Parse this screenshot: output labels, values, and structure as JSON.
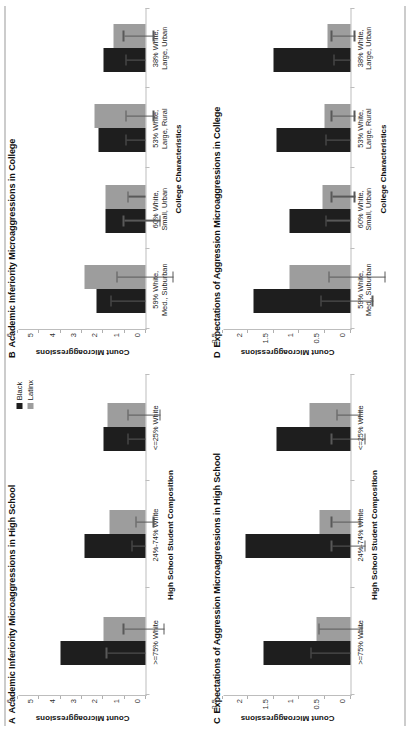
{
  "figure": {
    "legend": [
      {
        "label": "Black",
        "color": "#1e1e1e"
      },
      {
        "label": "Latinx",
        "color": "#9d9d9d"
      }
    ]
  },
  "chart_data": [
    {
      "type": "bar",
      "panel": "A",
      "title": "Academic Inferiority Microaggressions in High School",
      "xlabel": "High School Student Composition",
      "ylabel": "Count Microaggressions",
      "ylim": [
        0,
        6
      ],
      "yticks": [
        0,
        1,
        2,
        3,
        4,
        5,
        6
      ],
      "ytick_labels": [
        "0",
        "1",
        "2",
        "3",
        "4",
        "5",
        "6"
      ],
      "grid": false,
      "legend_position": "top-right",
      "categories": [
        ">=75% White",
        "24%-74% White",
        "<=25% White"
      ],
      "series": [
        {
          "name": "Black",
          "values": [
            4.0,
            2.9,
            2.0
          ],
          "err_high": [
            5.8,
            3.5,
            2.8
          ],
          "err_low": [
            4.0,
            2.9,
            2.0
          ]
        },
        {
          "name": "Latinx",
          "values": [
            2.0,
            1.7,
            1.8
          ],
          "err_high": [
            3.0,
            2.1,
            2.6
          ],
          "err_low": [
            1.1,
            1.3,
            1.1
          ]
        }
      ]
    },
    {
      "type": "bar",
      "panel": "B",
      "title": "Academic Inferiority Microaggressions in College",
      "xlabel": "College Characteristics",
      "ylabel": "Count Microaggressions",
      "ylim": [
        0,
        6
      ],
      "yticks": [
        0,
        1,
        2,
        3,
        4,
        5,
        6
      ],
      "ytick_labels": [
        "0",
        "1",
        "2",
        "3",
        "4",
        "5",
        "6"
      ],
      "grid": false,
      "legend_position": "none",
      "categories": [
        "59% White,\nMed., Suburban",
        "60% White,\nSmall, Urban",
        "53% White,\nLarge, Rural",
        "38% White,\nLarge, Urban"
      ],
      "series": [
        {
          "name": "Black",
          "values": [
            2.3,
            1.9,
            2.2,
            2.0
          ],
          "err_high": [
            3.9,
            2.9,
            3.1,
            2.9
          ],
          "err_low": [
            2.3,
            1.2,
            2.2,
            2.0
          ]
        },
        {
          "name": "Latinx",
          "values": [
            2.9,
            1.9,
            2.4,
            1.5
          ],
          "err_high": [
            4.2,
            2.7,
            3.3,
            2.5
          ],
          "err_low": [
            1.6,
            1.9,
            2.0,
            1.1
          ]
        }
      ]
    },
    {
      "type": "bar",
      "panel": "C",
      "title": "Expectations of Aggression Microaggressions in High School",
      "xlabel": "High School Student Composition",
      "ylabel": "Count Microaggressions",
      "ylim": [
        0,
        2.5
      ],
      "yticks": [
        0,
        0.5,
        1,
        1.5,
        2,
        2.5
      ],
      "ytick_labels": [
        "0",
        "0.5",
        "1",
        "1.5",
        "2",
        "2.5"
      ],
      "grid": false,
      "legend_position": "none",
      "categories": [
        ">=75% White",
        "24%-74% White",
        "<=25% White"
      ],
      "series": [
        {
          "name": "Black",
          "values": [
            1.7,
            2.05,
            1.45
          ],
          "err_high": [
            2.45,
            2.4,
            1.8
          ],
          "err_low": [
            1.7,
            1.75,
            1.15
          ]
        },
        {
          "name": "Latinx",
          "values": [
            0.65,
            0.6,
            0.8
          ],
          "err_high": [
            1.25,
            0.95,
            1.05
          ],
          "err_low": [
            0.4,
            0.4,
            0.6
          ]
        }
      ]
    },
    {
      "type": "bar",
      "panel": "D",
      "title": "Expectations of Aggression Microaggressions in College",
      "xlabel": "College Characteristics",
      "ylabel": "Count Microaggressions",
      "ylim": [
        0,
        2.5
      ],
      "yticks": [
        0,
        0.5,
        1,
        1.5,
        2,
        2.5
      ],
      "ytick_labels": [
        "0",
        "0.5",
        "1",
        "1.5",
        "2",
        "2.5"
      ],
      "grid": false,
      "legend_position": "none",
      "categories": [
        "59% White,\nMed., Suburban",
        "60% White,\nSmall, Urban",
        "53% White,\nLarge, Rural",
        "38% White,\nLarge, Urban"
      ],
      "series": [
        {
          "name": "Black",
          "values": [
            1.9,
            1.2,
            1.45,
            1.5
          ],
          "err_high": [
            2.45,
            1.65,
            1.9,
            1.8
          ],
          "err_low": [
            1.45,
            1.2,
            1.45,
            1.5
          ]
        },
        {
          "name": "Latinx",
          "values": [
            1.2,
            0.55,
            0.5,
            0.45
          ],
          "err_high": [
            1.6,
            0.9,
            0.85,
            0.8
          ],
          "err_low": [
            0.5,
            0.45,
            0.4,
            0.35
          ]
        }
      ]
    }
  ]
}
